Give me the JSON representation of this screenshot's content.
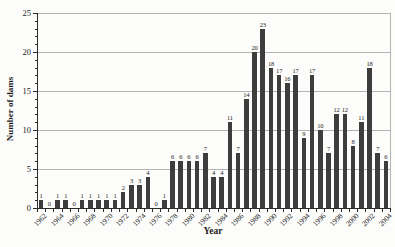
{
  "figure": {
    "background_color": "#fcfcfb",
    "bar_color": "#3d3d3d",
    "grid_color": "#b4b4b4",
    "axis_color": "#2b2b2b",
    "text_color": "#1c1c1c"
  },
  "chart_data": {
    "type": "bar",
    "title": "",
    "xlabel": "Year",
    "ylabel": "Number of dams",
    "ylim": [
      0,
      25
    ],
    "yticks": [
      0,
      5,
      10,
      15,
      20,
      25
    ],
    "y_minor_tick_step": 1,
    "grid": "horizontal",
    "legend": "none",
    "bar_value_labels": true,
    "x_tick_label_rotation": -45,
    "x_tick_label_every": 2,
    "categories": [
      1962,
      1963,
      1964,
      1965,
      1966,
      1967,
      1968,
      1969,
      1970,
      1971,
      1972,
      1973,
      1974,
      1975,
      1976,
      1977,
      1978,
      1979,
      1980,
      1981,
      1982,
      1983,
      1984,
      1985,
      1986,
      1987,
      1988,
      1989,
      1990,
      1991,
      1992,
      1993,
      1994,
      1995,
      1996,
      1997,
      1998,
      1999,
      2000,
      2001,
      2002,
      2003,
      2004
    ],
    "values": [
      1,
      0,
      1,
      1,
      0,
      1,
      1,
      1,
      1,
      1,
      2,
      3,
      3,
      4,
      0,
      1,
      6,
      6,
      6,
      6,
      7,
      4,
      4,
      11,
      7,
      14,
      20,
      23,
      18,
      17,
      16,
      17,
      9,
      17,
      10,
      7,
      12,
      12,
      8,
      11,
      18,
      7,
      6
    ]
  }
}
